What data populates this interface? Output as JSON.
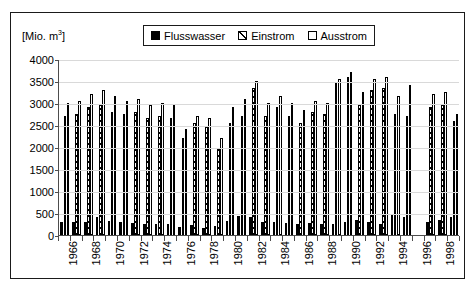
{
  "figure": {
    "unit_label": "[Mio. m",
    "unit_exponent": "3",
    "unit_close": "]"
  },
  "legend": {
    "position": "top-center",
    "items": [
      {
        "label": "Flusswasser",
        "swatch": "solid-black-swatch-icon"
      },
      {
        "label": "Einstrom",
        "swatch": "hatched-swatch-icon"
      },
      {
        "label": "Ausstrom",
        "swatch": "white-swatch-icon"
      }
    ]
  },
  "chart_data": {
    "type": "bar",
    "title": "",
    "subtitle": "",
    "xlabel": "",
    "ylabel": "[Mio. m3]",
    "ylim": [
      0,
      4000
    ],
    "yticks": [
      0,
      500,
      1000,
      1500,
      2000,
      2500,
      3000,
      3500,
      4000
    ],
    "ytick_labels": [
      "0",
      "500",
      "1000",
      "1500",
      "2000",
      "2500",
      "3000",
      "3500",
      "4000"
    ],
    "grid": true,
    "legend_position": "top-center",
    "categories": [
      "1966",
      "1967",
      "1968",
      "1969",
      "1970",
      "1971",
      "1972",
      "1973",
      "1974",
      "1975",
      "1976",
      "1977",
      "1978",
      "1979",
      "1980",
      "1981",
      "1982",
      "1983",
      "1984",
      "1985",
      "1986",
      "1987",
      "1988",
      "1989",
      "1990",
      "1991",
      "1992",
      "1993",
      "1994",
      "1995",
      "1996",
      "1997",
      "1998",
      "1999"
    ],
    "xtick_labels_shown": [
      "1966",
      "1968",
      "1970",
      "1972",
      "1974",
      "1976",
      "1978",
      "1980",
      "1982",
      "1984",
      "1986",
      "1988",
      "1990",
      "1992",
      "1994",
      "1996",
      "1998"
    ],
    "series": [
      {
        "name": "Flusswasser",
        "color": "#000000",
        "fill": "solid",
        "values": [
          300,
          290,
          300,
          420,
          310,
          300,
          280,
          250,
          260,
          250,
          180,
          230,
          170,
          200,
          320,
          440,
          420,
          300,
          300,
          280,
          260,
          280,
          250,
          240,
          300,
          330,
          300,
          260,
          450,
          400,
          null,
          300,
          350,
          400
        ]
      },
      {
        "name": "Einstrom",
        "color": "#000000",
        "fill": "hatched",
        "values": [
          2700,
          2750,
          2900,
          2950,
          2800,
          2750,
          2800,
          2650,
          2700,
          2650,
          2200,
          2550,
          2450,
          1950,
          2550,
          2700,
          3350,
          2700,
          2900,
          2700,
          2550,
          2800,
          2750,
          3450,
          3600,
          2950,
          3300,
          3350,
          2750,
          2700,
          null,
          2900,
          2950,
          2600
        ]
      },
      {
        "name": "Ausstrom",
        "color": "#ffffff",
        "fill": "empty",
        "values": [
          3000,
          3050,
          3200,
          3300,
          3150,
          3050,
          3100,
          2950,
          3000,
          2950,
          2400,
          2700,
          2650,
          2200,
          2900,
          3100,
          3500,
          3000,
          3150,
          3000,
          2850,
          3050,
          3000,
          3550,
          3700,
          3250,
          3550,
          3600,
          3150,
          3400,
          null,
          3200,
          3250,
          2750
        ]
      }
    ]
  }
}
